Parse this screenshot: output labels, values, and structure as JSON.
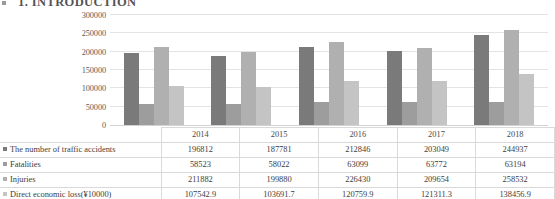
{
  "document": {
    "section_heading": "1. INTRODUCTION"
  },
  "chart_data": {
    "type": "bar",
    "title": "",
    "xlabel": "",
    "ylabel": "",
    "grid": true,
    "legend_position": "bottom-table",
    "categories": [
      "2014",
      "2015",
      "2016",
      "2017",
      "2018"
    ],
    "ylim": [
      0,
      300000
    ],
    "yticks": [
      "0",
      "50000",
      "100000",
      "150000",
      "200000",
      "250000",
      "300000"
    ],
    "ytick_values": [
      0,
      50000,
      100000,
      150000,
      200000,
      250000,
      300000
    ],
    "series": [
      {
        "name": "The number of traffic accidents",
        "color": "#7a7a7a",
        "values": [
          196812,
          187781,
          212846,
          203049,
          244937
        ]
      },
      {
        "name": "Fatalities",
        "color": "#9d9d9d",
        "values": [
          58523,
          58022,
          63099,
          63772,
          63194
        ]
      },
      {
        "name": "Injuries",
        "color": "#b0b0b0",
        "values": [
          211882,
          199880,
          226430,
          209654,
          258532
        ]
      },
      {
        "name": "Direct economic loss(¥10000)",
        "color": "#c4c4c4",
        "values": [
          107542.9,
          103691.7,
          120759.9,
          121311.3,
          138456.9
        ]
      }
    ]
  },
  "table": {
    "year_row": [
      "2014",
      "2015",
      "2016",
      "2017",
      "2018"
    ],
    "rows": [
      {
        "label": "The number of traffic accidents",
        "values": [
          "196812",
          "187781",
          "212846",
          "203049",
          "244937"
        ]
      },
      {
        "label": "Fatalities",
        "values": [
          "58523",
          "58022",
          "63099",
          "63772",
          "63194"
        ]
      },
      {
        "label": "Injuries",
        "values": [
          "211882",
          "199880",
          "226430",
          "209654",
          "258532"
        ]
      },
      {
        "label": "Direct economic loss(¥10000)",
        "values": [
          "107542.9",
          "103691.7",
          "120759.9",
          "121311.3",
          "138456.9"
        ]
      }
    ]
  }
}
